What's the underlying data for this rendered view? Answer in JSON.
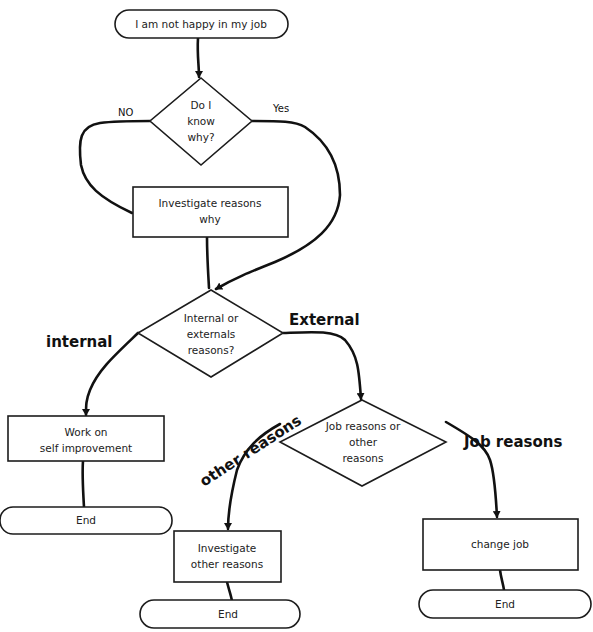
{
  "diagram": {
    "type": "flowchart",
    "nodes": {
      "start": {
        "shape": "terminal",
        "lines": [
          "I am not happy in my job"
        ]
      },
      "know_why": {
        "shape": "decision",
        "lines": [
          "Do I",
          "know",
          "why?"
        ]
      },
      "investigate_why": {
        "shape": "process",
        "lines": [
          "Investigate reasons",
          "why"
        ]
      },
      "int_ext": {
        "shape": "decision",
        "lines": [
          "Internal or",
          "externals",
          "reasons?"
        ]
      },
      "self_improve": {
        "shape": "process",
        "lines": [
          "Work on",
          "self improvement"
        ]
      },
      "end_internal": {
        "shape": "terminal",
        "lines": [
          "End"
        ]
      },
      "job_or_other": {
        "shape": "decision",
        "lines": [
          "Job reasons or",
          "other",
          "reasons"
        ]
      },
      "investigate_other": {
        "shape": "process",
        "lines": [
          "Investigate",
          "other reasons"
        ]
      },
      "end_other": {
        "shape": "terminal",
        "lines": [
          "End"
        ]
      },
      "change_job": {
        "shape": "process",
        "lines": [
          "change job"
        ]
      },
      "end_job": {
        "shape": "terminal",
        "lines": [
          "End"
        ]
      }
    },
    "edge_labels": {
      "no": "NO",
      "yes": "Yes",
      "internal": "internal",
      "external": "External",
      "other_reasons": "other reasons",
      "job_reasons": "Job reasons"
    },
    "edges": [
      {
        "from": "start",
        "to": "know_why"
      },
      {
        "from": "know_why",
        "to": "investigate_why",
        "label": "NO"
      },
      {
        "from": "know_why",
        "to": "int_ext",
        "label": "Yes"
      },
      {
        "from": "investigate_why",
        "to": "int_ext"
      },
      {
        "from": "int_ext",
        "to": "self_improve",
        "label": "internal"
      },
      {
        "from": "int_ext",
        "to": "job_or_other",
        "label": "External"
      },
      {
        "from": "self_improve",
        "to": "end_internal"
      },
      {
        "from": "job_or_other",
        "to": "investigate_other",
        "label": "other reasons"
      },
      {
        "from": "job_or_other",
        "to": "change_job",
        "label": "Job reasons"
      },
      {
        "from": "investigate_other",
        "to": "end_other"
      },
      {
        "from": "change_job",
        "to": "end_job"
      }
    ]
  }
}
